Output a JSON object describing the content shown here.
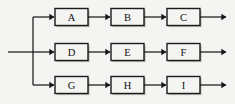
{
  "diagram": {
    "type": "block-flow-diagram",
    "background_color": "#f4f4f2",
    "line_color": "#1a1a1a",
    "box_fill_color": "#f4f4f2",
    "box_shadow_color": "#b9b9b5",
    "label_color": "#111111",
    "input": {
      "label": "",
      "start_x": 8,
      "y": 52
    },
    "bus": {
      "x": 33,
      "top_y": 17,
      "bottom_y": 85
    },
    "rows": [
      {
        "name": "row-top",
        "y": 17,
        "blocks": [
          {
            "label": "A",
            "x": 55,
            "width": 33,
            "height": 17
          },
          {
            "label": "B",
            "x": 111,
            "width": 33,
            "height": 17
          },
          {
            "label": "C",
            "x": 167,
            "width": 33,
            "height": 17
          }
        ],
        "output_arrow_x": 226
      },
      {
        "name": "row-middle",
        "y": 52,
        "blocks": [
          {
            "label": "D",
            "x": 55,
            "width": 33,
            "height": 17
          },
          {
            "label": "E",
            "x": 111,
            "width": 33,
            "height": 17
          },
          {
            "label": "F",
            "x": 167,
            "width": 33,
            "height": 17
          }
        ],
        "output_arrow_x": 226
      },
      {
        "name": "row-bottom",
        "y": 85,
        "blocks": [
          {
            "label": "G",
            "x": 55,
            "width": 33,
            "height": 17
          },
          {
            "label": "H",
            "x": 111,
            "width": 33,
            "height": 17
          },
          {
            "label": "I",
            "x": 167,
            "width": 33,
            "height": 17
          }
        ],
        "output_arrow_x": 226
      }
    ]
  }
}
